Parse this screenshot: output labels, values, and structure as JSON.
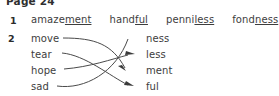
{
  "page": {
    "header": "Page 24"
  },
  "exercise1": {
    "number": "1",
    "words": [
      {
        "stem": "amaze",
        "suffix": "ment"
      },
      {
        "stem": "hand",
        "suffix": "ful"
      },
      {
        "stem": "penni",
        "suffix": "less"
      },
      {
        "stem": "fond",
        "suffix": "ness"
      }
    ]
  },
  "exercise2": {
    "number": "2",
    "left_column": [
      "move",
      "tear",
      "hope",
      "sad"
    ],
    "right_column": [
      "ness",
      "less",
      "ment",
      "ful"
    ],
    "matches": [
      {
        "from": "move",
        "to": "ment"
      },
      {
        "from": "tear",
        "to": "ful"
      },
      {
        "from": "hope",
        "to": "less"
      },
      {
        "from": "sad",
        "to": "ness"
      }
    ]
  },
  "colors": {
    "text": "#3d3d3d",
    "line": "#4a4a4a",
    "background": "#ffffff"
  }
}
